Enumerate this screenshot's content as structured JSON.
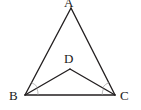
{
  "figure": {
    "type": "geometry-diagram",
    "background_color": "#ffffff",
    "stroke_color": "#231f20",
    "label_color": "#1a1a1a",
    "width": 141,
    "height": 110
  },
  "points": {
    "A": {
      "label": "A",
      "x": 71,
      "y": 8
    },
    "B": {
      "label": "B",
      "x": 25,
      "y": 95
    },
    "C": {
      "label": "C",
      "x": 115,
      "y": 95
    },
    "D": {
      "label": "D",
      "x": 70,
      "y": 69
    }
  },
  "segments": [
    {
      "name": "AB",
      "from": "A",
      "to": "B"
    },
    {
      "name": "AC",
      "from": "A",
      "to": "C"
    },
    {
      "name": "BC",
      "from": "B",
      "to": "C"
    },
    {
      "name": "DB",
      "from": "D",
      "to": "B"
    },
    {
      "name": "DC",
      "from": "D",
      "to": "C"
    }
  ],
  "angle_marks": [
    {
      "name": "angle-ABD",
      "vertex": "B",
      "style": "arc"
    },
    {
      "name": "angle-DBC",
      "vertex": "B",
      "style": "arc"
    },
    {
      "name": "angle-ACD",
      "vertex": "C",
      "style": "arc"
    },
    {
      "name": "angle-DCB",
      "vertex": "C",
      "style": "arc"
    }
  ]
}
